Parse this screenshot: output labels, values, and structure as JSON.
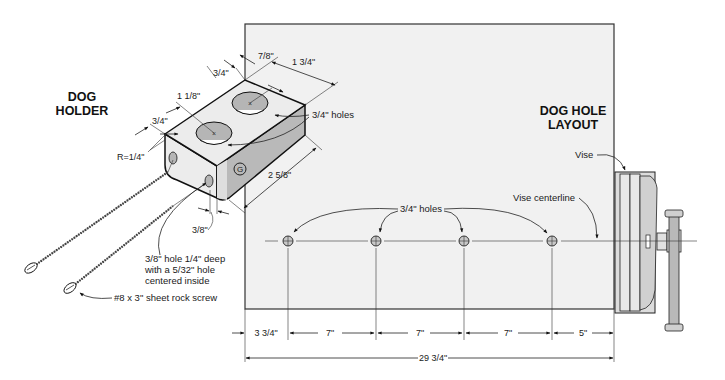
{
  "dog_holder": {
    "title_line1": "DOG",
    "title_line2": "HOLDER",
    "dims": {
      "top_edge": "3/4\"",
      "hole_spacing": "1 1/8\"",
      "side_edge": "3/4\"",
      "radius": "R=1/4\"",
      "hole_offset": "7/8\"",
      "width": "1 3/4\"",
      "length": "2 5/8\"",
      "screw_hole_offset": "3/8\""
    },
    "holes_label": "3/4\" holes",
    "stamp_letter": "G",
    "screw_hole_note_line1": "3/8\" hole 1/4\" deep",
    "screw_hole_note_line2": "with a 5/32\" hole",
    "screw_hole_note_line3": "centered inside",
    "screw_label": "#8 x 3\" sheet rock screw"
  },
  "dog_hole_layout": {
    "title_line1": "DOG HOLE",
    "title_line2": "LAYOUT",
    "vise_label": "Vise",
    "vise_centerline_label": "Vise centerline",
    "holes_label": "3/4\" holes",
    "spacing": [
      "3 3/4\"",
      "7\"",
      "7\"",
      "7\"",
      "5\""
    ],
    "total": "29 3/4\""
  },
  "colors": {
    "board_fill": "#f1f1f1",
    "hole_fill": "#b8b8b8",
    "block_side": "#c8c8c8",
    "line": "#222222"
  }
}
